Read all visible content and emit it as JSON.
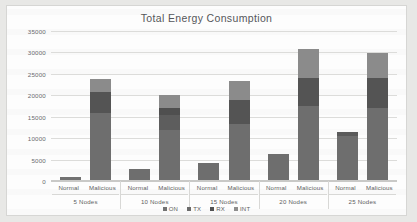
{
  "chart_data": {
    "type": "bar",
    "title": "Total Energy Consumption",
    "xlabel": "",
    "ylabel": "",
    "ylim": [
      0,
      35000
    ],
    "yticks": [
      0,
      5000,
      10000,
      15000,
      20000,
      25000,
      30000,
      35000
    ],
    "ytick_labels": [
      "0",
      "5000",
      "10000",
      "15000",
      "20000",
      "25000",
      "30000",
      "35000"
    ],
    "grid": true,
    "stacked": true,
    "legend_position": "bottom",
    "legend": [
      "ON",
      "TX",
      "RX",
      "INT"
    ],
    "group_labels": [
      "5 Nodes",
      "10 Nodes",
      "15 Nodes",
      "20 Nodes",
      "25 Nodes"
    ],
    "bar_labels": [
      "Normal",
      "Malicious"
    ],
    "series": [
      {
        "name": "ON",
        "color": "#727272",
        "values": [
          900,
          15800,
          2900,
          11800,
          4100,
          13300,
          6400,
          17500,
          10500,
          17000
        ]
      },
      {
        "name": "TX",
        "color": "#6b6b6b",
        "values": [
          0,
          0,
          0,
          3700,
          0,
          0,
          0,
          0,
          1000,
          0
        ]
      },
      {
        "name": "RX",
        "color": "#525252",
        "values": [
          0,
          5000,
          0,
          1500,
          0,
          5500,
          0,
          6600,
          0,
          7000
        ]
      },
      {
        "name": "INT",
        "color": "#8d8d8d",
        "values": [
          0,
          3000,
          0,
          3100,
          0,
          4600,
          0,
          6700,
          0,
          5800
        ]
      }
    ],
    "bars": [
      {
        "group": "5 Nodes",
        "label": "Normal",
        "total": 900,
        "segments": [
          {
            "series": "ON",
            "value": 900,
            "color": "#727272"
          }
        ]
      },
      {
        "group": "5 Nodes",
        "label": "Malicious",
        "total": 23800,
        "segments": [
          {
            "series": "ON",
            "value": 15800,
            "color": "#6e6e6e"
          },
          {
            "series": "RX",
            "value": 5000,
            "color": "#545454"
          },
          {
            "series": "INT",
            "value": 3000,
            "color": "#8b8b8b"
          }
        ]
      },
      {
        "group": "10 Nodes",
        "label": "Normal",
        "total": 2900,
        "segments": [
          {
            "series": "ON",
            "value": 2900,
            "color": "#6e6e6e"
          }
        ]
      },
      {
        "group": "10 Nodes",
        "label": "Malicious",
        "total": 20100,
        "segments": [
          {
            "series": "ON",
            "value": 11800,
            "color": "#6e6e6e"
          },
          {
            "series": "TX",
            "value": 3700,
            "color": "#5d5d5d"
          },
          {
            "series": "RX",
            "value": 1500,
            "color": "#4f4f4f"
          },
          {
            "series": "INT",
            "value": 3100,
            "color": "#8b8b8b"
          }
        ]
      },
      {
        "group": "15 Nodes",
        "label": "Normal",
        "total": 4100,
        "segments": [
          {
            "series": "ON",
            "value": 4100,
            "color": "#6e6e6e"
          }
        ]
      },
      {
        "group": "15 Nodes",
        "label": "Malicious",
        "total": 23400,
        "segments": [
          {
            "series": "ON",
            "value": 13300,
            "color": "#6e6e6e"
          },
          {
            "series": "RX",
            "value": 5500,
            "color": "#545454"
          },
          {
            "series": "INT",
            "value": 4600,
            "color": "#8b8b8b"
          }
        ]
      },
      {
        "group": "20 Nodes",
        "label": "Normal",
        "total": 6400,
        "segments": [
          {
            "series": "ON",
            "value": 6400,
            "color": "#6e6e6e"
          }
        ]
      },
      {
        "group": "20 Nodes",
        "label": "Malicious",
        "total": 30800,
        "segments": [
          {
            "series": "ON",
            "value": 17500,
            "color": "#6e6e6e"
          },
          {
            "series": "RX",
            "value": 6600,
            "color": "#545454"
          },
          {
            "series": "INT",
            "value": 6700,
            "color": "#8b8b8b"
          }
        ]
      },
      {
        "group": "25 Nodes",
        "label": "Normal",
        "total": 11500,
        "segments": [
          {
            "series": "ON",
            "value": 10500,
            "color": "#6e6e6e"
          },
          {
            "series": "RX",
            "value": 1000,
            "color": "#5a5a5a"
          }
        ]
      },
      {
        "group": "25 Nodes",
        "label": "Malicious",
        "total": 29800,
        "segments": [
          {
            "series": "ON",
            "value": 17000,
            "color": "#6e6e6e"
          },
          {
            "series": "RX",
            "value": 7000,
            "color": "#545454"
          },
          {
            "series": "INT",
            "value": 5800,
            "color": "#8b8b8b"
          }
        ]
      }
    ]
  }
}
